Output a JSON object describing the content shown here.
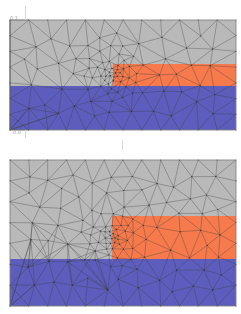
{
  "figure": {
    "panels": [
      {
        "id": "coarse-mesh",
        "top_label": "0.1",
        "bottom_label": "0.0",
        "regions": [
          {
            "name": "background",
            "color": "#b9b9b9"
          },
          {
            "name": "step-layer",
            "color": "#f67a4c"
          },
          {
            "name": "substrate",
            "color": "#5d5dbd"
          }
        ]
      },
      {
        "id": "refined-mesh",
        "top_label": "",
        "bottom_label": "",
        "regions": [
          {
            "name": "background",
            "color": "#b9b9b9"
          },
          {
            "name": "step-layer",
            "color": "#f67a4c"
          },
          {
            "name": "substrate",
            "color": "#5d5dbd"
          }
        ]
      }
    ],
    "mesh_line_color": "#3a3a3a"
  }
}
